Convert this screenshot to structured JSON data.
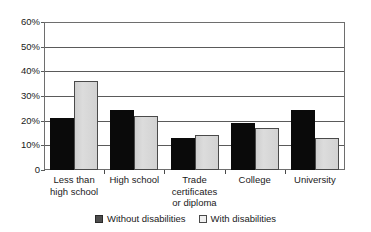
{
  "chart_data": {
    "type": "bar",
    "title": "",
    "subtitle": "",
    "xlabel": "",
    "ylabel": "",
    "ylim": [
      0,
      60
    ],
    "grid": true,
    "legend_position": "bottom",
    "categories": [
      "Less than high school",
      "High school",
      "Trade certificates or diploma",
      "College",
      "University"
    ],
    "category_lines": [
      [
        "Less than",
        "high school"
      ],
      [
        "High school"
      ],
      [
        "Trade",
        "certificates",
        "or diploma"
      ],
      [
        "College"
      ],
      [
        "University"
      ]
    ],
    "ytick_labels": [
      "60%",
      "50%",
      "40%",
      "30%",
      "20%",
      "10%",
      "0"
    ],
    "ytick_values": [
      60,
      50,
      40,
      30,
      20,
      10,
      0
    ],
    "series": [
      {
        "name": "Without disabilities",
        "color": "#0a0a0a",
        "values": [
          21,
          24.5,
          13,
          19,
          24.5
        ]
      },
      {
        "name": "With disabilities",
        "color": "#d4d4d4",
        "values": [
          36,
          22,
          14,
          17,
          13
        ]
      }
    ]
  },
  "legend": {
    "items": [
      {
        "label": "Without disabilities",
        "swatch": "dark-swatch-icon"
      },
      {
        "label": "With disabilities",
        "swatch": "light-swatch-icon"
      }
    ]
  }
}
